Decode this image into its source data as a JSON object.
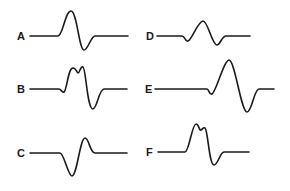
{
  "figure": {
    "line_color": "#1a1a1a",
    "background": "#ffffff",
    "panels": [
      {
        "label": "A",
        "shape": "biphasic: positive peak then negative trough",
        "path": "M30,36 L58,36 C63,36 65,11 71,11 C77,11 79,50 84,50 C88,50 91,36 95,36 L128,36"
      },
      {
        "label": "B",
        "shape": "notched double positive peak then negative trough",
        "path": "M30,89 L59,89 C61,89 62,93 64,92 C67,90 68,68 73,68 C76,68 77,73 78,73 C80,73 80,66 83,67 C86,68 87,109 93,109 C97,109 99,89 104,89 L127,89"
      },
      {
        "label": "C",
        "shape": "negative trough then small positive peak",
        "path": "M30,153 L60,153 C64,153 68,176 72,176 C77,176 80,138 85,138 C89,138 90,153 95,153 L127,153"
      },
      {
        "label": "D",
        "shape": "triphasic: small dip, positive peak, negative trough",
        "path": "M157,36 L182,36 C185,36 185,42 188,41 C192,40 198,21 203,21 C208,21 212,45 217,45 C220,45 222,36 226,36 L250,36"
      },
      {
        "label": "E",
        "shape": "wide triphasic: small dip, tall positive peak, deep trough",
        "path": "M155,89 L207,89 C209,89 209,95 212,94 C216,92 224,60 229,60 C235,60 241,112 247,112 C252,112 254,89 259,89 L274,89"
      },
      {
        "label": "F",
        "shape": "notched positive peak then negative trough",
        "path": "M158,152 L185,152 C189,152 192,124 196,124 C199,124 199,131 201,130 C203,129 203,127 205,128 C208,130 209,165 214,165 C218,165 220,152 224,152 L249,152"
      }
    ]
  },
  "labels": {
    "A": {
      "text": "A",
      "x": 17,
      "y": 40
    },
    "B": {
      "text": "B",
      "x": 17,
      "y": 93
    },
    "C": {
      "text": "C",
      "x": 17,
      "y": 157
    },
    "D": {
      "text": "D",
      "x": 147,
      "y": 40
    },
    "E": {
      "text": "E",
      "x": 146,
      "y": 93
    },
    "F": {
      "text": "F",
      "x": 147,
      "y": 156
    }
  }
}
